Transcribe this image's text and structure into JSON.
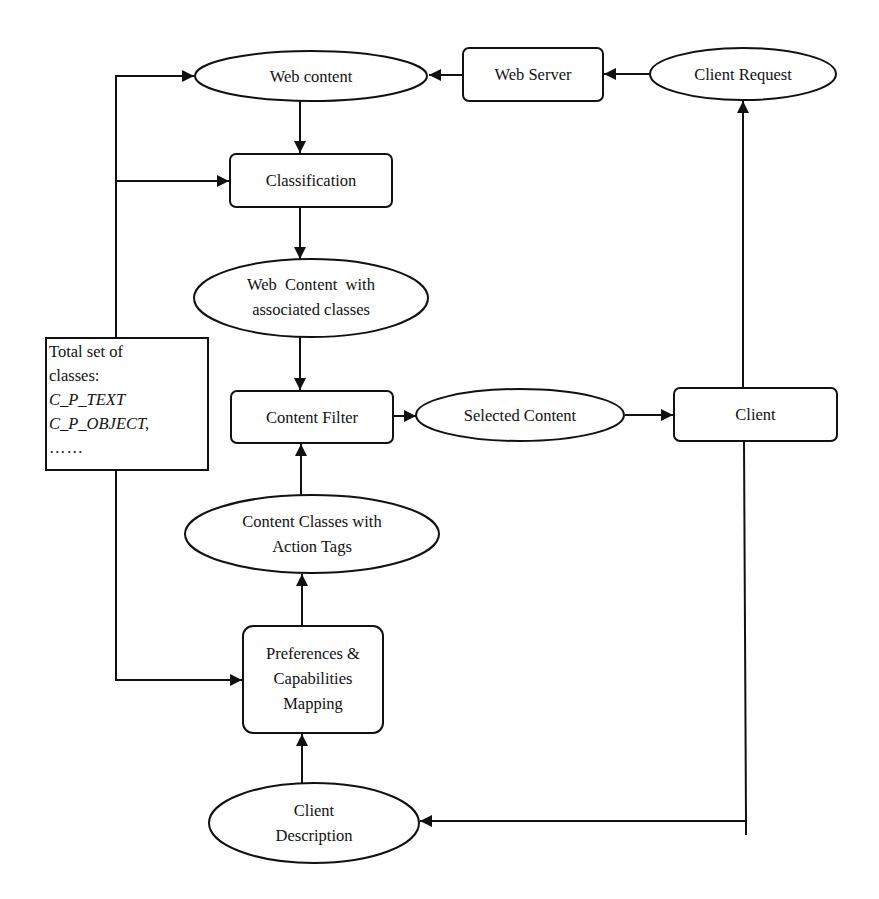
{
  "diagram": {
    "nodes": {
      "web_content": {
        "label": "Web content",
        "shape": "ellipse"
      },
      "web_server": {
        "label": "Web Server",
        "shape": "rounded-rect"
      },
      "client_request": {
        "label": "Client Request",
        "shape": "ellipse"
      },
      "classification": {
        "label": "Classification",
        "shape": "rounded-rect"
      },
      "web_content_classes": {
        "line1": "Web  Content  with",
        "line2": "associated classes",
        "shape": "ellipse"
      },
      "total_classes": {
        "line1": "Total set of",
        "line2": "classes:",
        "line3": "C_P_TEXT",
        "line4": "C_P_OBJECT,",
        "line5": "……",
        "shape": "rect"
      },
      "content_filter": {
        "label": "Content Filter",
        "shape": "rounded-rect"
      },
      "selected_content": {
        "label": "Selected Content",
        "shape": "ellipse"
      },
      "client": {
        "label": "Client",
        "shape": "rounded-rect"
      },
      "content_classes_tags": {
        "line1": "Content Classes with",
        "line2": "Action Tags",
        "shape": "ellipse"
      },
      "preferences_mapping": {
        "line1": "Preferences &",
        "line2": "Capabilities",
        "line3": "Mapping",
        "shape": "rounded-rect"
      },
      "client_description": {
        "line1": "Client",
        "line2": "Description",
        "shape": "ellipse"
      }
    },
    "edges": [
      {
        "from": "client_request",
        "to": "web_server"
      },
      {
        "from": "web_server",
        "to": "web_content"
      },
      {
        "from": "web_content",
        "to": "classification"
      },
      {
        "from": "classification",
        "to": "web_content_classes"
      },
      {
        "from": "web_content_classes",
        "to": "content_filter"
      },
      {
        "from": "content_filter",
        "to": "selected_content"
      },
      {
        "from": "selected_content",
        "to": "client"
      },
      {
        "from": "client",
        "to": "client_request"
      },
      {
        "from": "client",
        "to": "client_description"
      },
      {
        "from": "client_description",
        "to": "preferences_mapping"
      },
      {
        "from": "preferences_mapping",
        "to": "content_classes_tags"
      },
      {
        "from": "content_classes_tags",
        "to": "content_filter"
      },
      {
        "from": "total_classes",
        "to": "web_content"
      },
      {
        "from": "total_classes",
        "to": "classification"
      },
      {
        "from": "total_classes",
        "to": "preferences_mapping"
      }
    ],
    "colors": {
      "stroke": "#111111",
      "background": "#ffffff"
    }
  }
}
